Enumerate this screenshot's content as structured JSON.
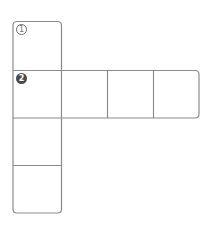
{
  "diagram": {
    "type": "cube-net",
    "stroke_color": "#8c8c8c",
    "labels": [
      {
        "id": "face-1",
        "text": "1",
        "style": "outlined-circle"
      },
      {
        "id": "face-2",
        "text": "2",
        "style": "filled-circle"
      }
    ],
    "faces": [
      {
        "name": "top",
        "row": 0,
        "col": 0,
        "label": "1"
      },
      {
        "name": "middle-left",
        "row": 1,
        "col": 0,
        "label": "2"
      },
      {
        "name": "middle-2",
        "row": 1,
        "col": 1,
        "label": ""
      },
      {
        "name": "middle-3",
        "row": 1,
        "col": 2,
        "label": ""
      },
      {
        "name": "middle-4",
        "row": 1,
        "col": 3,
        "label": ""
      },
      {
        "name": "lower-1",
        "row": 2,
        "col": 0,
        "label": ""
      },
      {
        "name": "lower-2",
        "row": 3,
        "col": 0,
        "label": ""
      }
    ]
  }
}
